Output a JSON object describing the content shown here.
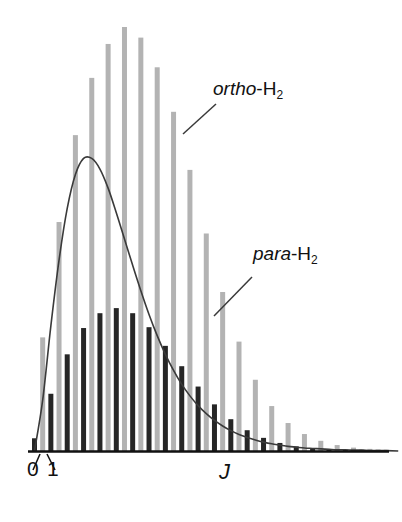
{
  "figure": {
    "name": "rotational-population-distribution-h2",
    "axis_label_x": "J",
    "tick_labels": [
      "0",
      "1"
    ],
    "background_color": "#ffffff",
    "axis_color": "#111111"
  },
  "labels": {
    "ortho": {
      "italic": "ortho",
      "roman": "-H",
      "subscript": "2"
    },
    "para": {
      "italic": "para",
      "roman": "-H",
      "subscript": "2"
    }
  },
  "colors": {
    "ortho_bar": "#b3b3b3",
    "para_bar": "#262626",
    "curve": "#3a3a3a",
    "axis": "#111111",
    "text": "#111111"
  },
  "chart_data": {
    "type": "bar",
    "title": "",
    "subtitle": "",
    "xlabel": "J",
    "ylabel": "",
    "grid": false,
    "legend_position": "inline-annotations",
    "xlim": [
      -0.5,
      43.5
    ],
    "ylim": [
      0,
      1.0
    ],
    "x_tick_values": [
      0,
      1
    ],
    "x_tick_labels": [
      "0",
      "1"
    ],
    "annotations": [
      {
        "text": "ortho-H2",
        "points_to_category": 19,
        "style": "italic-prefix"
      },
      {
        "text": "para-H2",
        "points_to_category": 24,
        "style": "italic-prefix"
      }
    ],
    "categories": [
      0,
      1,
      2,
      3,
      4,
      5,
      6,
      7,
      8,
      9,
      10,
      11,
      12,
      13,
      14,
      15,
      16,
      17,
      18,
      19,
      20,
      21,
      22,
      23,
      24,
      25,
      26,
      27,
      28,
      29,
      30,
      31,
      32,
      33,
      34,
      35,
      36,
      37,
      38,
      39,
      40,
      41,
      42,
      43
    ],
    "series": [
      {
        "name": "ortho-H2",
        "color": "#b3b3b3",
        "description": "odd J rotational states, nuclear spin weight 3",
        "values": [
          0.0,
          0.268,
          0.0,
          0.54,
          0.0,
          0.745,
          0.0,
          0.88,
          0.0,
          0.96,
          0.0,
          1.0,
          0.0,
          0.975,
          0.0,
          0.905,
          0.0,
          0.8,
          0.0,
          0.663,
          0.0,
          0.513,
          0.0,
          0.375,
          0.0,
          0.258,
          0.0,
          0.168,
          0.0,
          0.106,
          0.0,
          0.066,
          0.0,
          0.04,
          0.0,
          0.024,
          0.0,
          0.014,
          0.0,
          0.008,
          0.0,
          0.005,
          0.0,
          0.003
        ]
      },
      {
        "name": "para-H2",
        "color": "#262626",
        "description": "even J rotational states, nuclear spin weight 1",
        "values": [
          0.03,
          0.0,
          0.135,
          0.0,
          0.228,
          0.0,
          0.29,
          0.0,
          0.325,
          0.0,
          0.337,
          0.0,
          0.325,
          0.0,
          0.292,
          0.0,
          0.248,
          0.0,
          0.2,
          0.0,
          0.152,
          0.0,
          0.11,
          0.0,
          0.075,
          0.0,
          0.049,
          0.0,
          0.031,
          0.0,
          0.019,
          0.0,
          0.011,
          0.0,
          0.007,
          0.0,
          0.004,
          0.0,
          0.002,
          0.0,
          0.001,
          0.0,
          0.001,
          0.0
        ]
      },
      {
        "name": "envelope-curve",
        "type": "line",
        "color": "#3a3a3a",
        "description": "smooth Boltzmann rotational envelope (degeneracy x population)",
        "values": [
          0.0,
          0.12,
          0.295,
          0.45,
          0.572,
          0.652,
          0.69,
          0.69,
          0.665,
          0.62,
          0.562,
          0.5,
          0.438,
          0.378,
          0.322,
          0.272,
          0.228,
          0.19,
          0.157,
          0.13,
          0.107,
          0.088,
          0.072,
          0.059,
          0.048,
          0.039,
          0.032,
          0.026,
          0.021,
          0.017,
          0.014,
          0.011,
          0.009,
          0.007,
          0.006,
          0.005,
          0.004,
          0.003,
          0.003,
          0.002,
          0.002,
          0.001,
          0.001,
          0.001
        ]
      }
    ]
  }
}
